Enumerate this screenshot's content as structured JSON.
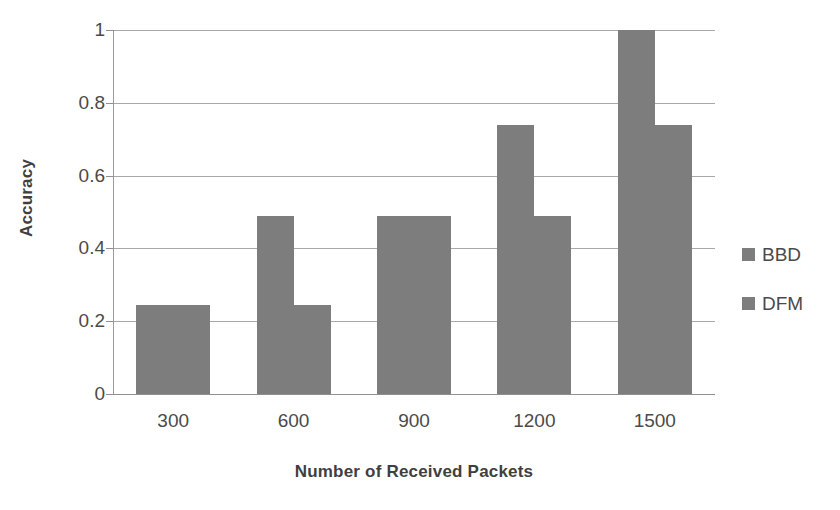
{
  "chart_data": {
    "type": "bar",
    "title": "",
    "xlabel": "Number of Received Packets",
    "ylabel": "Accuracy",
    "categories": [
      "300",
      "600",
      "900",
      "1200",
      "1500"
    ],
    "series": [
      {
        "name": "BBD",
        "values": [
          0.245,
          0.49,
          0.49,
          0.74,
          1.0
        ],
        "color": "#7d7d7d"
      },
      {
        "name": "DFM",
        "values": [
          0.245,
          0.245,
          0.49,
          0.49,
          0.74
        ],
        "color": "#7d7d7d"
      }
    ],
    "ylim": [
      0,
      1
    ],
    "yticks": [
      0,
      0.2,
      0.4,
      0.6,
      0.8,
      1
    ],
    "ytick_labels": [
      "0",
      "0.2",
      "0.4",
      "0.6",
      "0.8",
      "1"
    ],
    "grid": "horizontal",
    "legend_position": "right",
    "bar_color": "#7d7d7d",
    "gridline_color": "#a8a8a8",
    "axis_color": "#9a9a9a",
    "text_color": "#4a4a4a"
  },
  "legend": {
    "items": [
      {
        "label": "BBD"
      },
      {
        "label": "DFM"
      }
    ]
  }
}
